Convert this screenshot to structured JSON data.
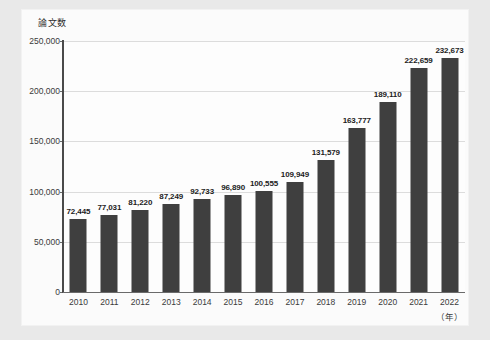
{
  "chart_data": {
    "type": "bar",
    "title": "",
    "ylabel": "論文数",
    "xlabel": "（年）",
    "categories": [
      "2010",
      "2011",
      "2012",
      "2013",
      "2014",
      "2015",
      "2016",
      "2017",
      "2018",
      "2019",
      "2020",
      "2021",
      "2022"
    ],
    "values": [
      72445,
      77031,
      81220,
      87249,
      92733,
      96890,
      100555,
      109949,
      131579,
      163777,
      189110,
      222659,
      232673
    ],
    "value_labels": [
      "72,445",
      "77,031",
      "81,220",
      "87,249",
      "92,733",
      "96,890",
      "100,555",
      "109,949",
      "131,579",
      "163,777",
      "189,110",
      "222,659",
      "232,673"
    ],
    "ylim": [
      0,
      250000
    ],
    "yticks": [
      0,
      50000,
      100000,
      150000,
      200000,
      250000
    ],
    "ytick_labels": [
      "0",
      "50,000",
      "100,000",
      "150,000",
      "200,000",
      "250,000"
    ],
    "grid": true,
    "legend": false,
    "bar_color": "#3f3f3f",
    "grid_color": "#dcdcdc",
    "plot_bg": "#fdfdfd",
    "page_bg": "#e9e9e9",
    "card_bg": "#fbfbfb"
  }
}
